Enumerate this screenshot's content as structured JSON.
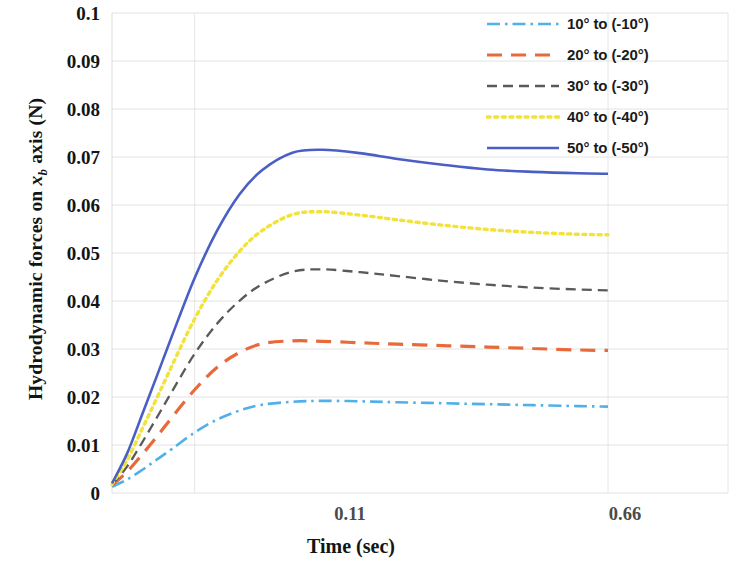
{
  "chart_data": {
    "type": "line",
    "title": "",
    "xlabel": "Time (sec)",
    "ylabel": "Hydrodynamic forces on x_b axis (N)",
    "ylabel_prefix": "Hydrodynamic forces on ",
    "ylabel_var": "x",
    "ylabel_sub": "b",
    "ylabel_suffix": " axis (N)",
    "xlim": [
      0,
      0.78
    ],
    "ylim": [
      0,
      0.1
    ],
    "grid": true,
    "grid_axis": "both",
    "legend_position": "top-right",
    "yticks": [
      "0.1",
      "0.09",
      "0.08",
      "0.07",
      "0.06",
      "0.05",
      "0.04",
      "0.03",
      "0.02",
      "0.01",
      "0"
    ],
    "ytick_values": [
      0.1,
      0.09,
      0.08,
      0.07,
      0.06,
      0.05,
      0.04,
      0.03,
      0.02,
      0.01,
      0
    ],
    "xticks": [
      "0.11",
      "0.66"
    ],
    "xtick_values": [
      0.11,
      0.66
    ],
    "x": [
      0.0,
      0.02,
      0.04,
      0.06,
      0.08,
      0.11,
      0.14,
      0.17,
      0.2,
      0.24,
      0.28,
      0.33,
      0.38,
      0.44,
      0.5,
      0.56,
      0.62,
      0.66
    ],
    "series": [
      {
        "name": "10° to (-10°)",
        "angle_label": "10° to (-10°)",
        "color": "#52b0e8",
        "style": "dash-dot",
        "dasharray": "13,5,2.5,5",
        "width": 2.6,
        "values": [
          0.0013,
          0.0028,
          0.0048,
          0.007,
          0.0092,
          0.0126,
          0.0153,
          0.0172,
          0.0184,
          0.019,
          0.0192,
          0.0191,
          0.0189,
          0.0187,
          0.0185,
          0.0183,
          0.0181,
          0.018
        ]
      },
      {
        "name": "20° to (-20°)",
        "angle_label": "20° to (-20°)",
        "color": "#e8693a",
        "style": "dashed",
        "dasharray": "15,9",
        "width": 3.2,
        "values": [
          0.0016,
          0.0044,
          0.008,
          0.0118,
          0.0158,
          0.0215,
          0.0262,
          0.0293,
          0.0311,
          0.0317,
          0.0316,
          0.0313,
          0.031,
          0.0307,
          0.0304,
          0.0301,
          0.0298,
          0.0297
        ]
      },
      {
        "name": "30° to (-30°)",
        "angle_label": "30° to (-30°)",
        "color": "#5a5a5a",
        "style": "dashed",
        "dasharray": "10,6",
        "width": 2.3,
        "values": [
          0.0017,
          0.0055,
          0.0105,
          0.0158,
          0.0212,
          0.029,
          0.0353,
          0.0401,
          0.0435,
          0.0461,
          0.0466,
          0.046,
          0.0452,
          0.0442,
          0.0434,
          0.0428,
          0.0424,
          0.0422
        ]
      },
      {
        "name": "40° to (-40°)",
        "angle_label": "40° to (-40°)",
        "color": "#f2e23c",
        "style": "dotted",
        "dasharray": "3.2,4.4",
        "width": 3.4,
        "values": [
          0.0018,
          0.0068,
          0.0133,
          0.0199,
          0.0266,
          0.0363,
          0.0443,
          0.0504,
          0.0547,
          0.058,
          0.0586,
          0.0579,
          0.0569,
          0.0558,
          0.0549,
          0.0543,
          0.0539,
          0.0538
        ]
      },
      {
        "name": "50° to (-50°)",
        "angle_label": "50° to (-50°)",
        "color": "#4a5fc4",
        "style": "solid",
        "dasharray": "none",
        "width": 2.6,
        "values": [
          0.002,
          0.0082,
          0.0163,
          0.0245,
          0.0328,
          0.0448,
          0.0547,
          0.0623,
          0.0673,
          0.0709,
          0.0715,
          0.0708,
          0.0696,
          0.0684,
          0.0674,
          0.0669,
          0.0666,
          0.0665
        ]
      }
    ]
  },
  "axes": {
    "plot_left_px": 112,
    "plot_right_px": 728,
    "plot_top_px": 13,
    "plot_bottom_px": 493,
    "data_end_px": 608
  }
}
